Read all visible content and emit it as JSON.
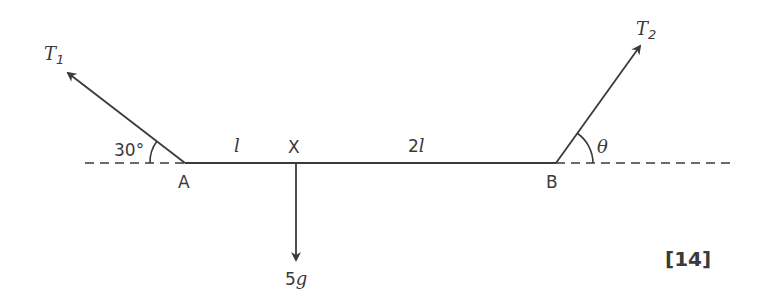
{
  "diagram": {
    "points": {
      "A": "A",
      "X": "X",
      "B": "B"
    },
    "lengths": {
      "AX": "l",
      "XB_coef": "2",
      "XB_var": "l"
    },
    "forces": {
      "T1_main": "T",
      "T1_sub": "1",
      "T2_main": "T",
      "T2_sub": "2",
      "weight_coef": "5",
      "weight_var": "g"
    },
    "angles": {
      "at_A": "30°",
      "at_B": "θ"
    },
    "marks": "[14]",
    "colors": {
      "line": "#3a3a3a",
      "background": "#ffffff"
    }
  }
}
